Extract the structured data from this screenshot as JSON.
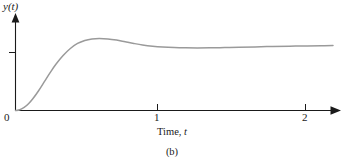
{
  "figure": {
    "caption": "(b)",
    "background_color": "#ffffff",
    "axis_color": "#1a1a1a",
    "curve_color": "#9a9a9a"
  },
  "chart_data": {
    "type": "line",
    "title": "",
    "subtitle": "",
    "xlabel": "Time, t",
    "ylabel": "y(t)",
    "xlim": [
      0,
      2.2
    ],
    "ylim": [
      0,
      1.35
    ],
    "grid": false,
    "legend": null,
    "x_ticks": [
      {
        "value": 0,
        "label": "0"
      },
      {
        "value": 1,
        "label": "1"
      },
      {
        "value": 2,
        "label": "2"
      }
    ],
    "y_ticks": [
      {
        "value": 1.0,
        "label": ""
      }
    ],
    "annotations": [],
    "series": [
      {
        "name": "step response",
        "x": [
          0.0,
          0.03,
          0.06,
          0.09,
          0.12,
          0.16,
          0.2,
          0.24,
          0.28,
          0.33,
          0.38,
          0.43,
          0.48,
          0.53,
          0.58,
          0.64,
          0.7,
          0.76,
          0.82,
          0.88,
          0.95,
          1.02,
          1.1,
          1.18,
          1.26,
          1.35,
          1.45,
          1.55,
          1.66,
          1.78,
          1.9,
          2.02,
          2.12,
          2.2
        ],
        "y": [
          0.0,
          0.012,
          0.045,
          0.1,
          0.175,
          0.295,
          0.43,
          0.565,
          0.69,
          0.82,
          0.925,
          1.0,
          1.045,
          1.068,
          1.075,
          1.068,
          1.05,
          1.025,
          1.0,
          0.978,
          0.96,
          0.948,
          0.94,
          0.936,
          0.934,
          0.935,
          0.938,
          0.943,
          0.949,
          0.955,
          0.96,
          0.964,
          0.966,
          0.968
        ]
      }
    ]
  }
}
